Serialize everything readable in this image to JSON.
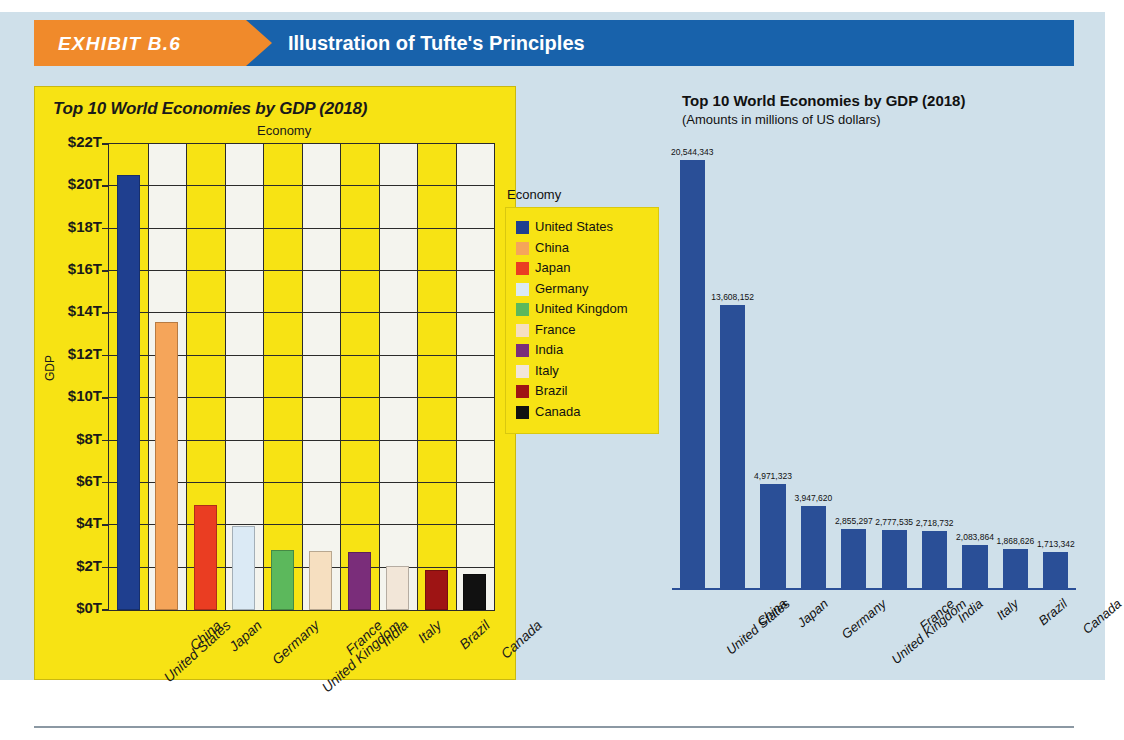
{
  "banner": {
    "exhibit_label": "EXHIBIT B.6",
    "title": "Illustration of Tufte's Principles"
  },
  "left_chart": {
    "title": "Top 10 World Economies by GDP (2018)",
    "top_caption": "Economy",
    "ylabel": "GDP",
    "legend_title": "Economy",
    "yticks": [
      "$22T",
      "$20T",
      "$18T",
      "$16T",
      "$14T",
      "$12T",
      "$10T",
      "$8T",
      "$6T",
      "$4T",
      "$2T",
      "$0T"
    ],
    "legend_items": [
      {
        "label": "United States",
        "color": "#1f3f8f"
      },
      {
        "label": "China",
        "color": "#f5a55a"
      },
      {
        "label": "Japan",
        "color": "#ea3d22"
      },
      {
        "label": "Germany",
        "color": "#dbeaf5"
      },
      {
        "label": "United Kingdom",
        "color": "#5cb85c"
      },
      {
        "label": "France",
        "color": "#f6dfc0"
      },
      {
        "label": "India",
        "color": "#7a2d7a"
      },
      {
        "label": "Italy",
        "color": "#f2e6d8"
      },
      {
        "label": "Brazil",
        "color": "#9e1414"
      },
      {
        "label": "Canada",
        "color": "#111111"
      }
    ]
  },
  "right_chart": {
    "title": "Top 10 World Economies by GDP (2018)",
    "subtitle": "(Amounts in millions of US dollars)",
    "bar_color": "#2a4f97"
  },
  "chart_data": [
    {
      "id": "left-cluttered",
      "type": "bar",
      "title": "Top 10 World Economies by GDP (2018)",
      "xlabel": "Economy",
      "ylabel": "GDP",
      "ylim": [
        0,
        22
      ],
      "ytick_values": [
        0,
        2,
        4,
        6,
        8,
        10,
        12,
        14,
        16,
        18,
        20,
        22
      ],
      "ytick_labels": [
        "$0T",
        "$2T",
        "$4T",
        "$6T",
        "$8T",
        "$10T",
        "$12T",
        "$14T",
        "$16T",
        "$18T",
        "$20T",
        "$22T"
      ],
      "unit": "trillions of US dollars",
      "grid": true,
      "legend_position": "right",
      "categories": [
        "United States",
        "China",
        "Japan",
        "Germany",
        "United Kingdom",
        "France",
        "India",
        "Italy",
        "Brazil",
        "Canada"
      ],
      "values": [
        20.544,
        13.608,
        4.971,
        3.948,
        2.855,
        2.778,
        2.719,
        2.084,
        1.869,
        1.713
      ],
      "bar_colors": [
        "#1f3f8f",
        "#f5a55a",
        "#ea3d22",
        "#dbeaf5",
        "#5cb85c",
        "#f6dfc0",
        "#7a2d7a",
        "#f2e6d8",
        "#9e1414",
        "#111111"
      ]
    },
    {
      "id": "right-clean",
      "type": "bar",
      "title": "Top 10 World Economies by GDP (2018)",
      "subtitle": "(Amounts in millions of US dollars)",
      "xlabel": "",
      "ylabel": "",
      "ylim": [
        0,
        20544343
      ],
      "grid": false,
      "legend_position": "none",
      "unit": "millions of US dollars",
      "categories": [
        "United States",
        "China",
        "Japan",
        "Germany",
        "United Kingdom",
        "France",
        "India",
        "Italy",
        "Brazil",
        "Canada"
      ],
      "values": [
        20544343,
        13608152,
        4971323,
        3947620,
        2855297,
        2777535,
        2718732,
        2083864,
        1868626,
        1713342
      ],
      "data_labels": [
        "20,544,343",
        "13,608,152",
        "4,971,323",
        "3,947,620",
        "2,855,297",
        "2,777,535",
        "2,718,732",
        "2,083,864",
        "1,868,626",
        "1,713,342"
      ],
      "series_color": "#2a4f97"
    }
  ]
}
